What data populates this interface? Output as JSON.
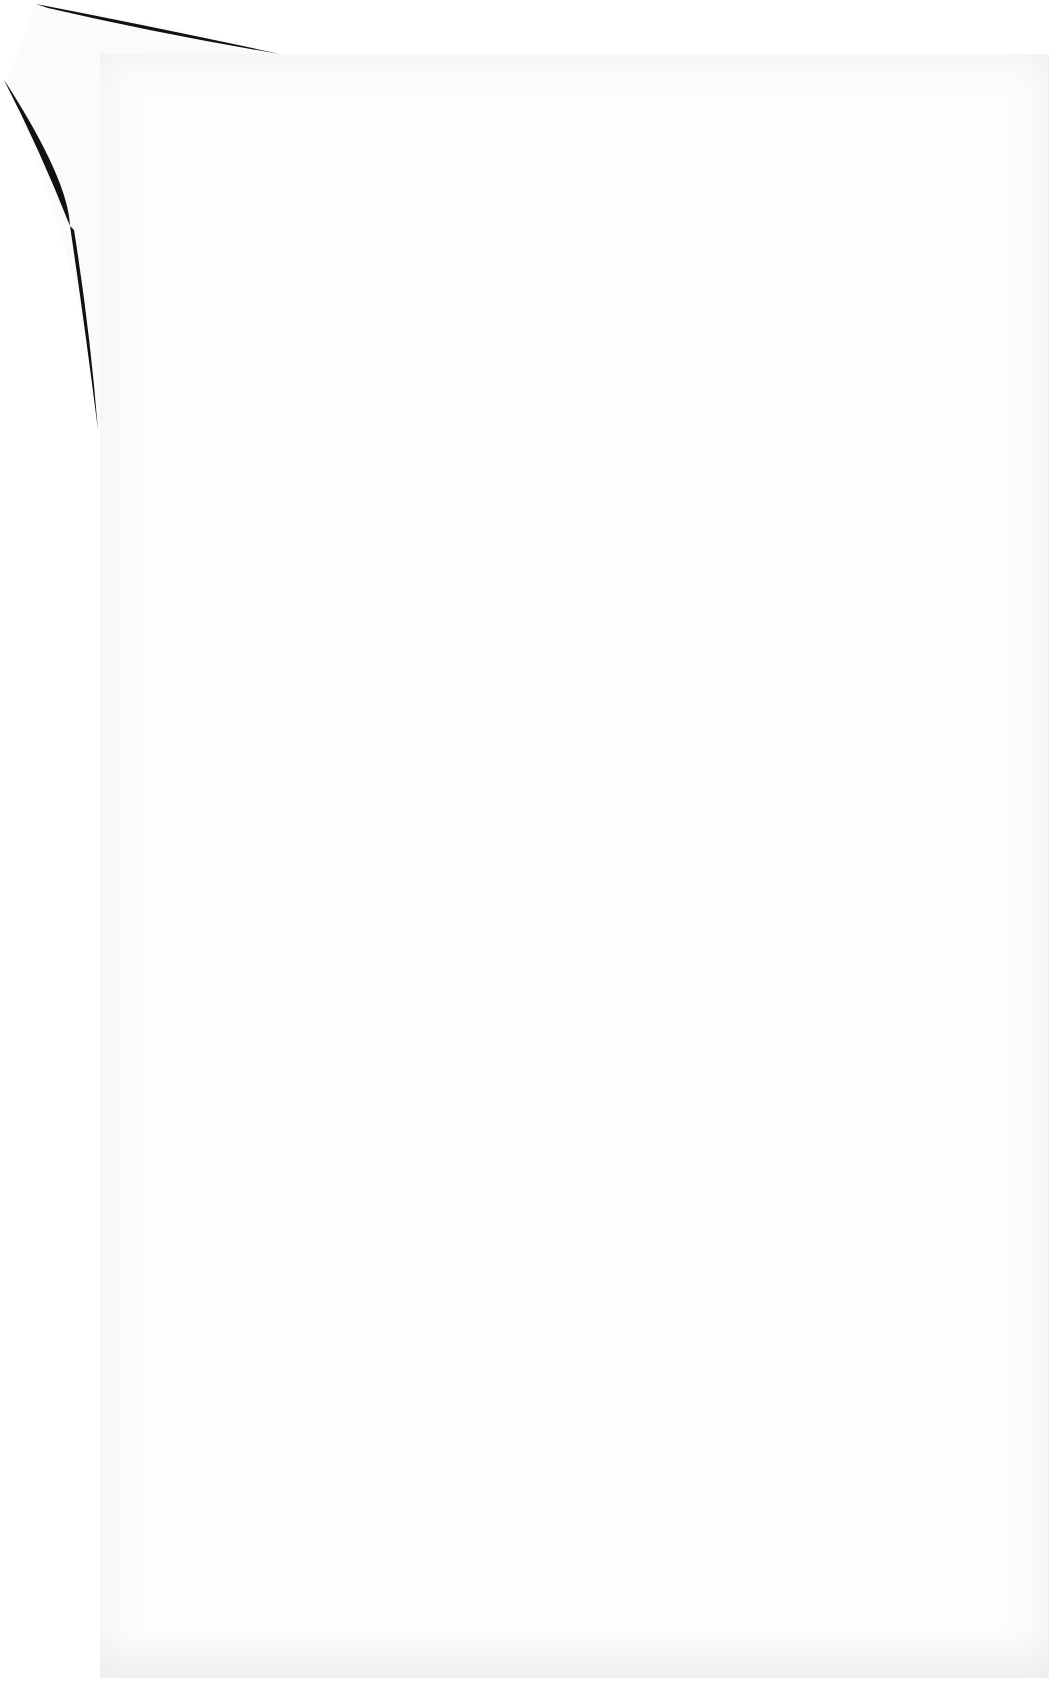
{
  "document": {
    "type": "scanned-page",
    "content": "",
    "colors": {
      "page": "#fdfdfd",
      "background": "#ffffff",
      "curl_shadow": "#000000"
    }
  }
}
